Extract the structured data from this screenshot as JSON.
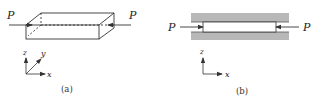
{
  "figure_a": {
    "caption": "(a)",
    "force_left_label": "P",
    "force_right_label": "P",
    "axes": {
      "z": "z",
      "y": "y",
      "x": "x"
    }
  },
  "figure_b": {
    "caption": "(b)",
    "force_left_label": "P",
    "force_right_label": "P",
    "axes": {
      "z": "z",
      "x": "x"
    }
  },
  "colors": {
    "line": "#333333",
    "plate_fill": "#b8b8b8",
    "background": "#ffffff"
  }
}
